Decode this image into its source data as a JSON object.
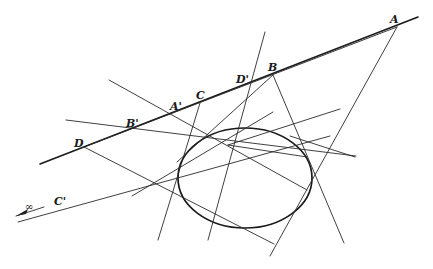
{
  "figure": {
    "labels": [
      {
        "id": "A",
        "text": "A",
        "x": 390,
        "y": 23
      },
      {
        "id": "B",
        "text": "B",
        "x": 268,
        "y": 71
      },
      {
        "id": "D_prime",
        "text": "D'",
        "x": 236,
        "y": 83
      },
      {
        "id": "C",
        "text": "C",
        "x": 196,
        "y": 99
      },
      {
        "id": "A_prime",
        "text": "A'",
        "x": 170,
        "y": 110
      },
      {
        "id": "B_prime",
        "text": "B'",
        "x": 126,
        "y": 127
      },
      {
        "id": "D",
        "text": "D",
        "x": 74,
        "y": 147
      },
      {
        "id": "C_prime",
        "text": "C'",
        "x": 54,
        "y": 205
      },
      {
        "id": "infinity",
        "text": "∞",
        "x": 25,
        "y": 210
      }
    ],
    "points": {
      "A": [
        397,
        27
      ],
      "B": [
        273,
        75
      ],
      "D_prime": [
        249,
        84
      ],
      "C": [
        200,
        103
      ],
      "A_prime": [
        171,
        114
      ],
      "B_prime": [
        131,
        130
      ],
      "D": [
        84,
        147
      ],
      "P": [
        228,
        145
      ]
    },
    "conic": {
      "type": "ellipse",
      "cx": 245,
      "cy": 178,
      "rx": 67,
      "ry": 50
    },
    "colors": {
      "ink": "#1a1a1a",
      "background": "#ffffff"
    }
  }
}
